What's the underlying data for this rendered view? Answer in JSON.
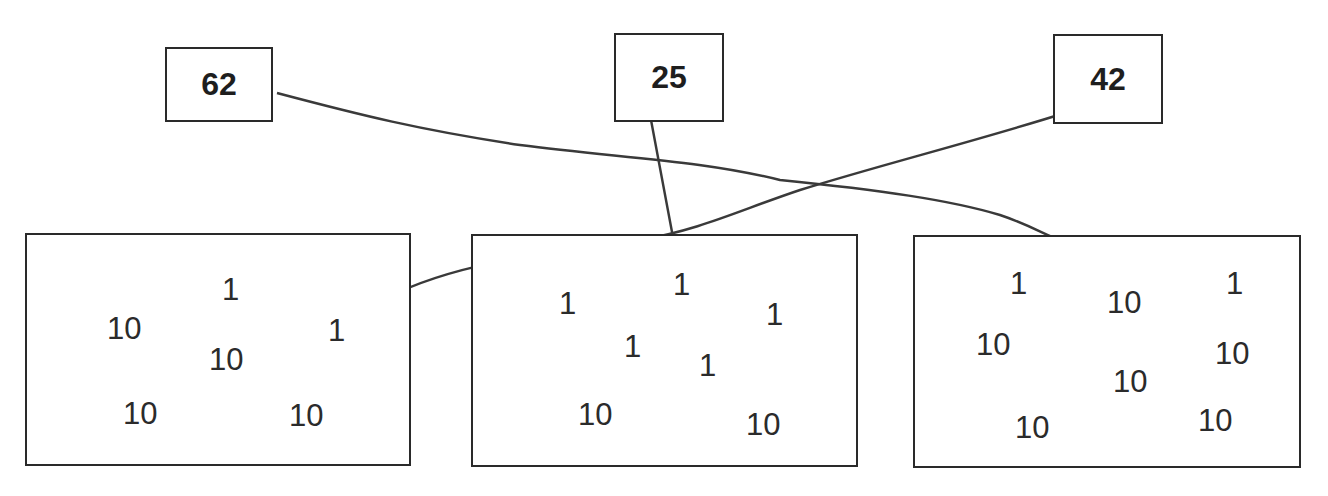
{
  "targets": [
    {
      "label": "62",
      "x": 165,
      "y": 47,
      "w": 108,
      "h": 75
    },
    {
      "label": "25",
      "x": 614,
      "y": 33,
      "w": 110,
      "h": 89
    },
    {
      "label": "42",
      "x": 1053,
      "y": 34,
      "w": 110,
      "h": 90
    }
  ],
  "groups": [
    {
      "x": 25,
      "y": 233,
      "w": 386,
      "h": 233,
      "numbers": [
        {
          "v": "1",
          "x": 220,
          "y": 272
        },
        {
          "v": "10",
          "x": 105,
          "y": 311
        },
        {
          "v": "1",
          "x": 326,
          "y": 313
        },
        {
          "v": "10",
          "x": 207,
          "y": 342
        },
        {
          "v": "10",
          "x": 121,
          "y": 396
        },
        {
          "v": "10",
          "x": 287,
          "y": 398
        }
      ]
    },
    {
      "x": 471,
      "y": 234,
      "w": 387,
      "h": 233,
      "numbers": [
        {
          "v": "1",
          "x": 671,
          "y": 267
        },
        {
          "v": "1",
          "x": 557,
          "y": 286
        },
        {
          "v": "1",
          "x": 764,
          "y": 297
        },
        {
          "v": "1",
          "x": 622,
          "y": 329
        },
        {
          "v": "1",
          "x": 697,
          "y": 348
        },
        {
          "v": "10",
          "x": 576,
          "y": 397
        },
        {
          "v": "10",
          "x": 744,
          "y": 407
        }
      ]
    },
    {
      "x": 913,
      "y": 235,
      "w": 388,
      "h": 233,
      "numbers": [
        {
          "v": "1",
          "x": 1008,
          "y": 266
        },
        {
          "v": "1",
          "x": 1224,
          "y": 266
        },
        {
          "v": "10",
          "x": 1105,
          "y": 285
        },
        {
          "v": "10",
          "x": 974,
          "y": 327
        },
        {
          "v": "10",
          "x": 1213,
          "y": 336
        },
        {
          "v": "10",
          "x": 1111,
          "y": 364
        },
        {
          "v": "10",
          "x": 1196,
          "y": 403
        },
        {
          "v": "10",
          "x": 1013,
          "y": 410
        }
      ]
    }
  ],
  "connections": [
    {
      "from": "62",
      "to": "group-3",
      "path": "M 277 93 C 360 115, 420 130, 520 145 C 620 158, 700 160, 780 180 C 880 190, 950 200, 1000 215 C 1030 225, 1045 235, 1062 241"
    },
    {
      "from": "25",
      "to": "group-2",
      "path": "M 648 104 L 675 248"
    },
    {
      "from": "42",
      "to": "group-1",
      "path": "M 1068 112 C 980 140, 880 165, 800 190 C 740 210, 700 230, 640 240 C 540 255, 450 262, 375 304"
    }
  ],
  "line_color": "#3a3a3a"
}
